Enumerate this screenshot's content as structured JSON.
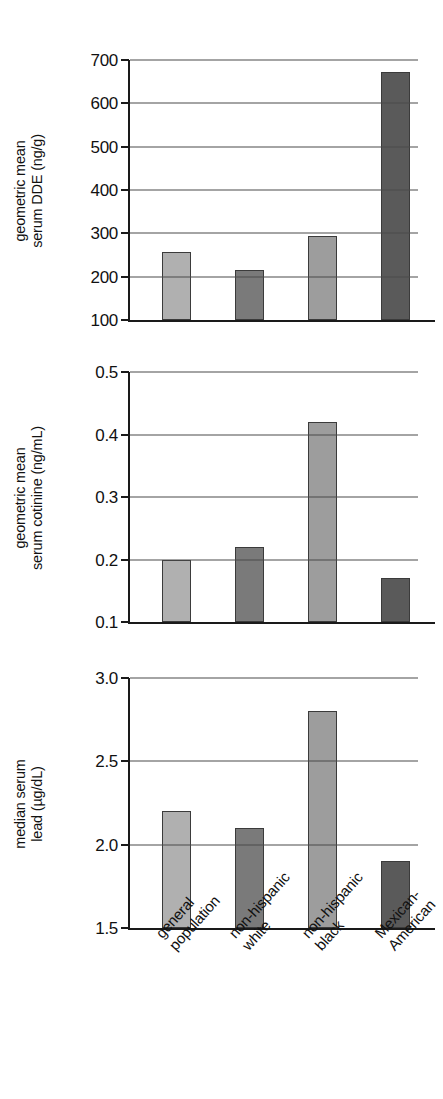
{
  "figure": {
    "categories": [
      "general population",
      "non-hispanic white",
      "non-hispanic black",
      "Mexican-American"
    ],
    "category_lines": [
      [
        "general",
        "population"
      ],
      [
        "non-hispanic",
        "white"
      ],
      [
        "non-hispanic",
        "black"
      ],
      [
        "Mexican-",
        "American"
      ]
    ],
    "bar_colors": [
      "#b0b0b0",
      "#7a7a7a",
      "#9d9d9d",
      "#5a5a5a"
    ],
    "axis_color": "#1a1a1a",
    "grid_color": "#4a4a4a",
    "background": "#ffffff"
  },
  "panels": [
    {
      "ylabel_lines": [
        "geometric mean",
        "serum DDE (ng/g)"
      ],
      "ticks": [
        "700",
        "600",
        "500",
        "400",
        "300",
        "200",
        "100"
      ]
    },
    {
      "ylabel_lines": [
        "geometric mean",
        "serum cotinine (ng/mL)"
      ],
      "ticks": [
        "0.5",
        "0.4",
        "0.3",
        "0.2",
        "0.1"
      ]
    },
    {
      "ylabel_lines": [
        "median serum",
        "lead (µg/dL)"
      ],
      "ticks": [
        "3.0",
        "2.5",
        "2.0",
        "1.5"
      ]
    }
  ],
  "chart_data": [
    {
      "type": "bar",
      "title": "",
      "xlabel": "",
      "ylabel": "geometric mean serum DDE (ng/g)",
      "categories": [
        "general population",
        "non-hispanic white",
        "non-hispanic black",
        "Mexican-American"
      ],
      "values": [
        258,
        215,
        293,
        672
      ],
      "ylim": [
        100,
        700
      ],
      "yticks": [
        100,
        200,
        300,
        400,
        500,
        600,
        700
      ],
      "grid": true,
      "legend": "none",
      "units": "ng/g"
    },
    {
      "type": "bar",
      "title": "",
      "xlabel": "",
      "ylabel": "geometric mean serum cotinine (ng/mL)",
      "categories": [
        "general population",
        "non-hispanic white",
        "non-hispanic black",
        "Mexican-American"
      ],
      "values": [
        0.2,
        0.22,
        0.42,
        0.17
      ],
      "ylim": [
        0.1,
        0.5
      ],
      "yticks": [
        0.1,
        0.2,
        0.3,
        0.4,
        0.5
      ],
      "grid": true,
      "legend": "none",
      "units": "ng/mL"
    },
    {
      "type": "bar",
      "title": "",
      "xlabel": "",
      "ylabel": "median serum lead (µg/dL)",
      "categories": [
        "general population",
        "non-hispanic white",
        "non-hispanic black",
        "Mexican-American"
      ],
      "values": [
        2.2,
        2.1,
        2.8,
        1.9
      ],
      "ylim": [
        1.5,
        3.0
      ],
      "yticks": [
        1.5,
        2.0,
        2.5,
        3.0
      ],
      "grid": true,
      "legend": "none",
      "units": "µg/dL"
    }
  ]
}
